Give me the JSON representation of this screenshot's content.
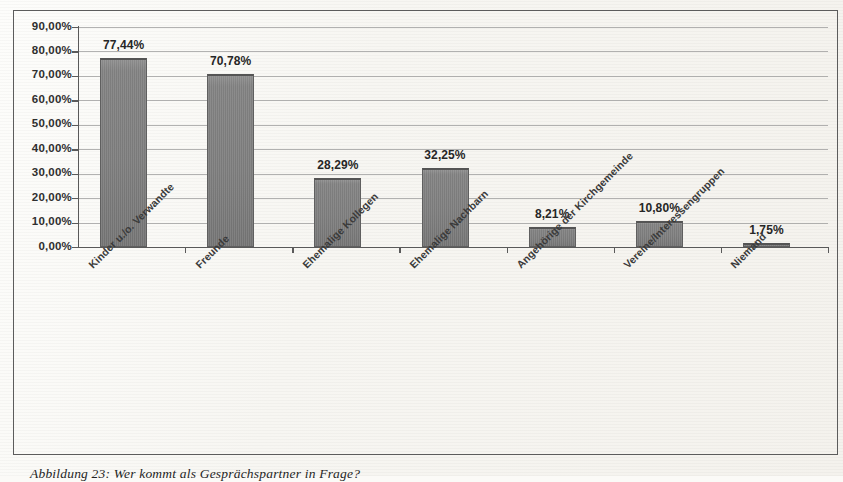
{
  "chart_data": {
    "type": "bar",
    "title": "",
    "xlabel": "",
    "ylabel": "",
    "grid": true,
    "legend": "none",
    "ylim": [
      0,
      90
    ],
    "ytick_labels": [
      "90,00%",
      "80,00%",
      "70,00%",
      "60,00%",
      "50,00%",
      "40,00%",
      "30,00%",
      "20,00%",
      "10,00%",
      "0,00%"
    ],
    "ytick_values": [
      90,
      80,
      70,
      60,
      50,
      40,
      30,
      20,
      10,
      0
    ],
    "categories": [
      "Kinder u./o. Verwandte",
      "Freunde",
      "Ehemalige Kollegen",
      "Ehemalige Nachbarn",
      "Angehörige der Kirchgemeinde",
      "Vereine/Interessengruppen",
      "Niemand"
    ],
    "values": [
      77.44,
      70.78,
      28.29,
      32.25,
      8.21,
      10.8,
      1.75
    ],
    "value_labels": [
      "77,44%",
      "70,78%",
      "28,29%",
      "32,25%",
      "8,21%",
      "10,80%",
      "1,75%"
    ],
    "bar_color": "#7a7a7a",
    "bar_edge_color": "#5f5f5f",
    "gridline_color": "#9a9a9a",
    "axis_color": "#595959"
  },
  "caption": {
    "text": "Abbildung 23: Wer kommt als Gesprächspartner in Frage?"
  }
}
